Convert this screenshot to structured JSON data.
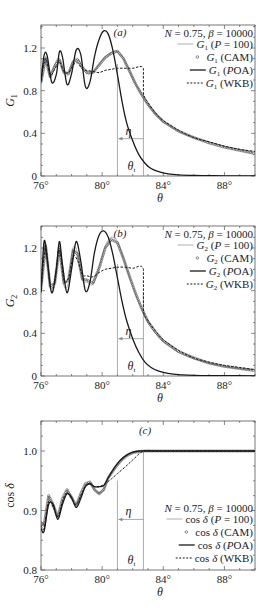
{
  "chart_data": [
    {
      "type": "line",
      "panel": "(a)",
      "title": "",
      "annotation": "N = 0.75, β = 10000",
      "xlabel": "θ",
      "ylabel": "G1",
      "xlim": [
        76,
        90
      ],
      "ylim": [
        0,
        1.42
      ],
      "xticks": [
        76,
        80,
        84,
        88
      ],
      "xtick_labels": [
        "76°",
        "80°",
        "84°",
        "88°"
      ],
      "yticks": [
        0,
        0.4,
        0.8,
        1.2
      ],
      "ytick_labels": [
        "0",
        "0.4",
        "0.8",
        "1.2"
      ],
      "markers": {
        "eta_theta": 81.0,
        "theta_t": 82.7,
        "eta_label": "η",
        "theta_t_label": "θt",
        "arrow_y": 0.35
      },
      "legend": [
        {
          "label": "G1 (P = 100)",
          "style": "thin-solid"
        },
        {
          "label": "G1 (CAM)",
          "style": "circle-marker"
        },
        {
          "label": "G1 (POA)",
          "style": "thick-solid"
        },
        {
          "label": "G1 (WKB)",
          "style": "dashed"
        }
      ],
      "series": [
        {
          "name": "G1 (P = 100)",
          "x": [
            76,
            76.3,
            76.6,
            76.9,
            77.2,
            77.5,
            77.8,
            78.1,
            78.4,
            78.7,
            79.0,
            79.4,
            79.8,
            80.2,
            80.6,
            81.0,
            81.4,
            81.8,
            82.2,
            82.6,
            83.0,
            83.5,
            84,
            85,
            86,
            87,
            88,
            89,
            90
          ],
          "y": [
            0.9,
            1.12,
            0.92,
            1.05,
            1.1,
            0.96,
            0.95,
            1.08,
            1.1,
            1.02,
            0.96,
            0.97,
            1.05,
            1.12,
            1.16,
            1.17,
            1.1,
            0.98,
            0.86,
            0.76,
            0.67,
            0.58,
            0.51,
            0.42,
            0.36,
            0.32,
            0.28,
            0.25,
            0.23
          ]
        },
        {
          "name": "G1 (CAM)",
          "x": [
            76,
            76.3,
            76.6,
            76.9,
            77.2,
            77.5,
            77.8,
            78.1,
            78.4,
            78.7,
            79.0,
            79.4,
            79.8,
            80.2,
            80.6,
            81.0,
            81.4,
            81.8,
            82.2,
            82.6,
            83.0,
            83.5,
            84,
            85,
            86,
            87,
            88,
            89,
            90
          ],
          "y": [
            0.88,
            1.1,
            0.93,
            1.03,
            1.09,
            0.97,
            0.96,
            1.07,
            1.09,
            1.02,
            0.97,
            0.97,
            1.04,
            1.11,
            1.15,
            1.17,
            1.1,
            0.98,
            0.86,
            0.76,
            0.67,
            0.58,
            0.51,
            0.42,
            0.36,
            0.31,
            0.27,
            0.24,
            0.21
          ]
        },
        {
          "name": "G1 (POA)",
          "x": [
            76,
            76.2,
            76.4,
            76.7,
            77.0,
            77.2,
            77.4,
            77.7,
            78.0,
            78.3,
            78.6,
            78.9,
            79.2,
            79.5,
            79.8,
            80.1,
            80.4,
            80.7,
            81.0,
            81.3,
            81.6,
            82.0,
            82.4,
            82.8,
            83.2,
            83.7,
            84.3,
            85,
            86,
            87,
            88,
            90
          ],
          "y": [
            0.88,
            1.13,
            1.13,
            0.88,
            0.95,
            1.16,
            1.12,
            0.86,
            0.96,
            1.18,
            1.14,
            0.84,
            0.88,
            1.12,
            1.28,
            1.36,
            1.33,
            1.18,
            0.95,
            0.7,
            0.5,
            0.33,
            0.2,
            0.12,
            0.07,
            0.04,
            0.02,
            0.01,
            0.005,
            0.003,
            0.002,
            0.001
          ]
        },
        {
          "name": "G1 (WKB)",
          "x": [
            76,
            76.3,
            76.6,
            76.9,
            77.2,
            77.5,
            77.8,
            78.1,
            78.4,
            78.7,
            79.0,
            79.4,
            79.8,
            80.2,
            80.6,
            81.0,
            81.5,
            82.0,
            82.7,
            82.7,
            83.0,
            83.5,
            84,
            85,
            86,
            87,
            88,
            89,
            90
          ],
          "y": [
            0.9,
            1.1,
            0.95,
            1.0,
            1.07,
            0.98,
            0.97,
            1.04,
            1.06,
            1.0,
            0.99,
            0.98,
            0.97,
            0.99,
            1.0,
            1.01,
            1.01,
            1.01,
            1.01,
            0.78,
            0.69,
            0.59,
            0.52,
            0.43,
            0.36,
            0.32,
            0.28,
            0.25,
            0.23
          ]
        }
      ]
    },
    {
      "type": "line",
      "panel": "(b)",
      "title": "",
      "annotation": "N = 0.75, β = 10000",
      "xlabel": "θ",
      "ylabel": "G2",
      "xlim": [
        76,
        90
      ],
      "ylim": [
        0,
        1.41
      ],
      "xticks": [
        76,
        80,
        84,
        88
      ],
      "xtick_labels": [
        "76°",
        "80°",
        "84°",
        "88°"
      ],
      "yticks": [
        0,
        0.4,
        0.8,
        1.2
      ],
      "ytick_labels": [
        "0",
        "0.4",
        "0.8",
        "1.2"
      ],
      "markers": {
        "eta_theta": 81.0,
        "theta_t": 82.7,
        "eta_label": "η",
        "theta_t_label": "θt",
        "arrow_y": 0.35
      },
      "legend": [
        {
          "label": "G2 (P = 100)",
          "style": "thin-solid"
        },
        {
          "label": "G2 (CAM)",
          "style": "circle-marker"
        },
        {
          "label": "G2 (POA)",
          "style": "thick-solid"
        },
        {
          "label": "G2 (WKB)",
          "style": "dashed"
        }
      ],
      "series": [
        {
          "name": "G2 (P = 100)",
          "x": [
            76,
            76.3,
            76.6,
            76.9,
            77.2,
            77.5,
            77.8,
            78.1,
            78.4,
            78.7,
            79.0,
            79.4,
            79.8,
            80.2,
            80.6,
            81.0,
            81.4,
            81.8,
            82.2,
            82.6,
            83.0,
            83.5,
            84,
            85,
            86,
            87,
            88,
            89,
            90
          ],
          "y": [
            0.8,
            1.25,
            0.82,
            0.85,
            1.22,
            0.85,
            0.88,
            1.2,
            1.15,
            0.9,
            0.88,
            0.86,
            1.02,
            1.22,
            1.3,
            1.26,
            1.1,
            0.92,
            0.76,
            0.62,
            0.5,
            0.4,
            0.32,
            0.22,
            0.16,
            0.12,
            0.09,
            0.07,
            0.06
          ]
        },
        {
          "name": "G2 (CAM)",
          "x": [
            76,
            76.3,
            76.6,
            76.9,
            77.2,
            77.5,
            77.8,
            78.1,
            78.4,
            78.7,
            79.0,
            79.4,
            79.8,
            80.2,
            80.6,
            81.0,
            81.4,
            81.8,
            82.2,
            82.6,
            83.0,
            83.5,
            84,
            85,
            86,
            87,
            88,
            89,
            90
          ],
          "y": [
            0.82,
            1.22,
            0.84,
            0.87,
            1.2,
            0.87,
            0.9,
            1.18,
            1.14,
            0.91,
            0.9,
            0.87,
            1.01,
            1.2,
            1.28,
            1.25,
            1.1,
            0.93,
            0.77,
            0.63,
            0.51,
            0.41,
            0.33,
            0.23,
            0.17,
            0.12,
            0.09,
            0.07,
            0.05
          ]
        },
        {
          "name": "G2 (POA)",
          "x": [
            76,
            76.2,
            76.4,
            76.7,
            77.0,
            77.2,
            77.4,
            77.7,
            78.0,
            78.3,
            78.6,
            78.9,
            79.2,
            79.5,
            79.8,
            80.1,
            80.4,
            80.7,
            81.0,
            81.3,
            81.6,
            82.0,
            82.4,
            82.8,
            83.2,
            83.7,
            84.3,
            85,
            86,
            87,
            88,
            90
          ],
          "y": [
            0.78,
            1.26,
            1.1,
            0.78,
            1.0,
            1.26,
            1.05,
            0.78,
            1.0,
            1.26,
            1.08,
            0.8,
            0.88,
            1.16,
            1.32,
            1.36,
            1.3,
            1.14,
            0.92,
            0.7,
            0.52,
            0.35,
            0.22,
            0.13,
            0.08,
            0.045,
            0.025,
            0.012,
            0.006,
            0.004,
            0.003,
            0.002
          ]
        },
        {
          "name": "G2 (WKB)",
          "x": [
            76,
            76.3,
            76.6,
            76.9,
            77.2,
            77.5,
            77.8,
            78.1,
            78.4,
            78.7,
            79.0,
            79.4,
            79.8,
            80.2,
            80.6,
            81.0,
            81.5,
            82.0,
            82.7,
            82.7,
            83.0,
            83.5,
            84,
            85,
            86,
            87,
            88,
            89,
            90
          ],
          "y": [
            0.8,
            1.2,
            0.85,
            0.88,
            1.18,
            0.9,
            0.92,
            1.12,
            1.08,
            0.95,
            0.94,
            0.93,
            0.97,
            1.0,
            1.01,
            1.02,
            1.02,
            1.01,
            1.0,
            0.62,
            0.52,
            0.42,
            0.34,
            0.24,
            0.17,
            0.13,
            0.1,
            0.08,
            0.06
          ]
        }
      ]
    },
    {
      "type": "line",
      "panel": "(c)",
      "title": "",
      "annotation": "N = 0.75, β = 10000",
      "xlabel": "θ",
      "ylabel": "cos δ",
      "xlim": [
        76,
        90
      ],
      "ylim": [
        0.8,
        1.05
      ],
      "xticks": [
        76,
        80,
        84,
        88
      ],
      "xtick_labels": [
        "76°",
        "80°",
        "84°",
        "88°"
      ],
      "yticks": [
        0.8,
        0.9,
        1.0
      ],
      "ytick_labels": [
        "0.8",
        "0.9",
        "1.0"
      ],
      "markers": {
        "eta_theta": 81.0,
        "theta_t": 82.7,
        "eta_label": "η",
        "theta_t_label": "θt",
        "arrow_y": 0.885
      },
      "legend": [
        {
          "label": "cos δ (P = 100)",
          "style": "thin-solid"
        },
        {
          "label": "cos δ (CAM)",
          "style": "circle-marker"
        },
        {
          "label": "cos δ (POA)",
          "style": "thick-solid"
        },
        {
          "label": "cos δ (WKB)",
          "style": "dashed"
        }
      ],
      "series": [
        {
          "name": "cos δ (P = 100)",
          "x": [
            76,
            76.2,
            76.5,
            76.8,
            77.1,
            77.4,
            77.7,
            78.0,
            78.3,
            78.6,
            78.9,
            79.2,
            79.5,
            79.8,
            80.1,
            80.4,
            80.8,
            81.2,
            81.6,
            82.0,
            82.4,
            82.8,
            83.5,
            85,
            88,
            90
          ],
          "y": [
            0.875,
            0.87,
            0.915,
            0.905,
            0.89,
            0.915,
            0.93,
            0.92,
            0.91,
            0.925,
            0.94,
            0.945,
            0.935,
            0.93,
            0.935,
            0.955,
            0.97,
            0.983,
            0.992,
            0.997,
            0.999,
            1.0,
            1.0,
            1.0,
            1.0,
            1.0
          ]
        },
        {
          "name": "cos δ (CAM)",
          "x": [
            76,
            76.2,
            76.5,
            76.8,
            77.1,
            77.4,
            77.7,
            78.0,
            78.3,
            78.6,
            78.9,
            79.2,
            79.5,
            79.8,
            80.1,
            80.4,
            80.8,
            81.2,
            81.6,
            82.0,
            82.4,
            82.8,
            83.5,
            85,
            88,
            90
          ],
          "y": [
            0.88,
            0.875,
            0.925,
            0.91,
            0.888,
            0.92,
            0.935,
            0.922,
            0.908,
            0.928,
            0.945,
            0.948,
            0.935,
            0.928,
            0.935,
            0.955,
            0.97,
            0.983,
            0.992,
            0.997,
            0.999,
            1.0,
            1.0,
            1.0,
            1.0,
            1.0
          ]
        },
        {
          "name": "cos δ (POA)",
          "x": [
            76,
            76.2,
            76.5,
            76.8,
            77.1,
            77.4,
            77.7,
            78.0,
            78.3,
            78.6,
            78.9,
            79.2,
            79.5,
            79.8,
            80.1,
            80.4,
            80.8,
            81.2,
            81.6,
            82.0,
            82.4,
            82.8,
            83.5,
            85,
            88,
            90
          ],
          "y": [
            0.87,
            0.865,
            0.91,
            0.91,
            0.885,
            0.91,
            0.928,
            0.922,
            0.905,
            0.92,
            0.94,
            0.945,
            0.94,
            0.94,
            0.942,
            0.955,
            0.972,
            0.985,
            0.993,
            0.998,
            1.0,
            1.0,
            1.0,
            1.0,
            1.0,
            1.0
          ]
        },
        {
          "name": "cos δ (WKB)",
          "x": [
            76,
            76.2,
            76.5,
            76.8,
            77.1,
            77.4,
            77.7,
            78.0,
            78.3,
            78.6,
            78.9,
            79.2,
            79.5,
            79.8,
            80.2,
            80.6,
            81.0,
            81.5,
            82.0,
            82.7,
            83.5,
            85,
            88,
            90
          ],
          "y": [
            0.875,
            0.87,
            0.915,
            0.905,
            0.89,
            0.915,
            0.93,
            0.92,
            0.91,
            0.925,
            0.94,
            0.945,
            0.94,
            0.94,
            0.945,
            0.953,
            0.962,
            0.973,
            0.985,
            1.0,
            1.0,
            1.0,
            1.0,
            1.0
          ]
        }
      ]
    }
  ],
  "panels": [
    {
      "tag": "(a)",
      "ylabel": "G",
      "ylabel_sub": "1",
      "xlabel": "θ",
      "note": "N = 0.75, β = 10000",
      "legend": [
        {
          "sym": "G",
          "sub": "1",
          "txt": " (P = 100)"
        },
        {
          "sym": "G",
          "sub": "1",
          "txt": " (CAM)"
        },
        {
          "sym": "G",
          "sub": "1",
          "txt": " (POA)"
        },
        {
          "sym": "G",
          "sub": "1",
          "txt": " (WKB)"
        }
      ],
      "eta": "η",
      "theta_t": "θ",
      "theta_t_sub": "t"
    },
    {
      "tag": "(b)",
      "ylabel": "G",
      "ylabel_sub": "2",
      "xlabel": "θ",
      "note": "N = 0.75, β = 10000",
      "legend": [
        {
          "sym": "G",
          "sub": "2",
          "txt": " (P = 100)"
        },
        {
          "sym": "G",
          "sub": "2",
          "txt": " (CAM)"
        },
        {
          "sym": "G",
          "sub": "2",
          "txt": " (POA)"
        },
        {
          "sym": "G",
          "sub": "2",
          "txt": " (WKB)"
        }
      ],
      "eta": "η",
      "theta_t": "θ",
      "theta_t_sub": "t"
    },
    {
      "tag": "(c)",
      "ylabel": "cos δ",
      "ylabel_sub": "",
      "xlabel": "θ",
      "note": "N = 0.75, β = 10000",
      "legend": [
        {
          "sym": "cos δ",
          "sub": "",
          "txt": " (P = 100)"
        },
        {
          "sym": "cos δ",
          "sub": "",
          "txt": " (CAM)"
        },
        {
          "sym": "cos δ",
          "sub": "",
          "txt": " (POA)"
        },
        {
          "sym": "cos δ",
          "sub": "",
          "txt": " (WKB)"
        }
      ],
      "eta": "η",
      "theta_t": "θ",
      "theta_t_sub": "t"
    }
  ],
  "colors": {
    "axis": "#555555",
    "line": "#1a1a1a",
    "grey_line": "#888888",
    "marker": "#444444"
  }
}
